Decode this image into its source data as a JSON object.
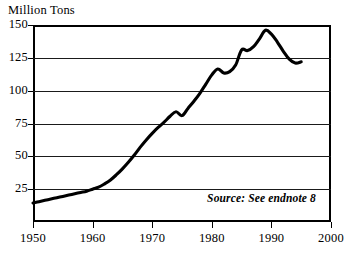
{
  "chart_data": {
    "type": "line",
    "title": "Million Tons",
    "xlabel": "",
    "ylabel": "Million Tons",
    "xlim": [
      1950,
      2000
    ],
    "ylim": [
      0,
      150
    ],
    "grid": true,
    "legend": false,
    "y_ticks": [
      150,
      125,
      100,
      75,
      50,
      25
    ],
    "y_tick_labels": [
      "150",
      "125",
      "100",
      "75",
      "50",
      "25"
    ],
    "x_ticks": [
      1950,
      1960,
      1970,
      1980,
      1990,
      2000
    ],
    "x_tick_labels": [
      "1950",
      "1960",
      "1970",
      "1980",
      "1990",
      "2000"
    ],
    "annotation": "Source: See endnote 8",
    "line_color": "#000000",
    "grid_color": "#1a1a1a",
    "background_color": "#ffffff",
    "series": [
      {
        "name": "Million Tons",
        "x": [
          1950,
          1951,
          1952,
          1953,
          1954,
          1955,
          1956,
          1957,
          1958,
          1959,
          1960,
          1961,
          1962,
          1963,
          1964,
          1965,
          1966,
          1967,
          1968,
          1969,
          1970,
          1971,
          1972,
          1973,
          1974,
          1975,
          1976,
          1977,
          1978,
          1979,
          1980,
          1981,
          1982,
          1983,
          1984,
          1985,
          1986,
          1987,
          1988,
          1989,
          1990,
          1991,
          1992,
          1993,
          1994,
          1995
        ],
        "values": [
          14.5,
          15.5,
          16.5,
          17.5,
          18.5,
          19.5,
          20.5,
          21.5,
          22.5,
          23.5,
          25.0,
          26.5,
          29.0,
          32.0,
          36.0,
          40.5,
          45.5,
          51.0,
          57.0,
          62.5,
          67.5,
          72.0,
          76.0,
          80.5,
          84.0,
          81.0,
          86.5,
          92.0,
          98.0,
          105.0,
          112.0,
          116.5,
          113.5,
          114.5,
          119.5,
          131.0,
          130.5,
          133.5,
          139.5,
          146.0,
          143.0,
          137.0,
          130.0,
          124.0,
          121.0,
          122.0
        ]
      }
    ]
  },
  "axis": {
    "y_caption": "Million Tons"
  },
  "note": {
    "text": "Source: See endnote 8"
  }
}
